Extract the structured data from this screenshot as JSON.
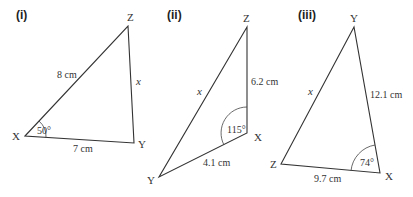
{
  "diagrams": [
    {
      "label": "(i)",
      "vertices": {
        "X": "X",
        "Y": "Y",
        "Z": "Z"
      },
      "sides": {
        "XZ": "8 cm",
        "XY": "7 cm",
        "ZY": "x"
      },
      "angle": {
        "vertex": "X",
        "value": "50°"
      }
    },
    {
      "label": "(ii)",
      "vertices": {
        "X": "X",
        "Y": "Y",
        "Z": "Z"
      },
      "sides": {
        "ZX": "6.2 cm",
        "XY": "4.1 cm",
        "ZY": "x"
      },
      "angle": {
        "vertex": "X",
        "value": "115°"
      }
    },
    {
      "label": "(iii)",
      "vertices": {
        "X": "X",
        "Y": "Y",
        "Z": "Z"
      },
      "sides": {
        "YX": "12.1 cm",
        "ZX": "9.7 cm",
        "YZ": "x"
      },
      "angle": {
        "vertex": "X",
        "value": "74°"
      }
    }
  ]
}
